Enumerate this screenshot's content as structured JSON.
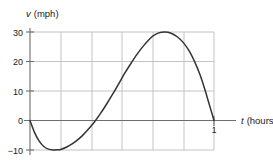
{
  "chart_data": {
    "type": "line",
    "title": "",
    "xlabel": "t (hours)",
    "ylabel": "v (mph)",
    "xlabel_var": "t",
    "xlabel_unit": "(hours)",
    "ylabel_var": "v",
    "ylabel_unit": "(mph)",
    "xlim": [
      0,
      1
    ],
    "ylim": [
      -10,
      30
    ],
    "xticks": [
      1
    ],
    "xtick_labels": [
      "1"
    ],
    "yticks": [
      30,
      20,
      10,
      0,
      -10
    ],
    "ytick_labels": [
      "30",
      "20",
      "10",
      "0",
      "−10"
    ],
    "grid": true,
    "grid_x_values": [
      0,
      0.1667,
      0.3333,
      0.5,
      0.6667,
      0.8333,
      1.0
    ],
    "grid_y_values": [
      30,
      20,
      10,
      0,
      -10
    ],
    "legend": "none",
    "series": [
      {
        "name": "velocity",
        "color": "#333333",
        "x": [
          0.0,
          0.025,
          0.05,
          0.075,
          0.1,
          0.125,
          0.15,
          0.1667,
          0.2,
          0.225,
          0.25,
          0.2833,
          0.3167,
          0.35,
          0.3833,
          0.4167,
          0.45,
          0.4833,
          0.5167,
          0.55,
          0.5833,
          0.6167,
          0.65,
          0.6667,
          0.7,
          0.7333,
          0.7667,
          0.8,
          0.8333,
          0.8667,
          0.9,
          0.925,
          0.95,
          0.975,
          1.0
        ],
        "y": [
          0.0,
          -4.1,
          -7.0,
          -8.8,
          -9.7,
          -10.0,
          -9.9,
          -9.8,
          -9.0,
          -8.1,
          -7.0,
          -5.2,
          -3.0,
          -0.5,
          2.4,
          5.6,
          9.0,
          12.6,
          16.2,
          19.5,
          22.6,
          25.3,
          27.6,
          28.6,
          29.7,
          30.0,
          29.6,
          28.4,
          26.4,
          23.4,
          19.2,
          15.3,
          10.6,
          5.3,
          0.0
        ]
      }
    ],
    "annotations": [
      {
        "text": "1",
        "x": 1.0,
        "y": -2.2,
        "role": "x-tick-label"
      }
    ]
  },
  "colors": {
    "curve": "#333333",
    "grid": "#b5b5b5",
    "axis": "#6e6e6e",
    "text": "#1a1a1a",
    "background": "#ffffff"
  }
}
